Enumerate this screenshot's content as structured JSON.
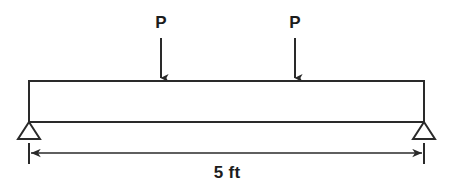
{
  "diagram": {
    "background_color": "#ffffff",
    "line_color": "#2a2a2a",
    "text_color": "#1c1c1c",
    "beam": {
      "left_x": 29,
      "right_x": 424,
      "top_y": 81,
      "bottom_y": 122,
      "stroke_width": 2
    },
    "loads": [
      {
        "label": "P",
        "x": 161,
        "label_y": 14,
        "shaft_top_y": 38,
        "tip_y": 81
      },
      {
        "label": "P",
        "x": 295,
        "label_y": 14,
        "shaft_top_y": 38,
        "tip_y": 81
      }
    ],
    "supports": [
      {
        "name": "left-pin-support",
        "apex_x": 29,
        "apex_y": 122,
        "half_width": 11,
        "height": 17
      },
      {
        "name": "right-pin-support",
        "apex_x": 424,
        "apex_y": 122,
        "half_width": 11,
        "height": 17
      }
    ],
    "dimension": {
      "label": "5 ft",
      "label_x": 227,
      "label_y": 164,
      "line_y": 153,
      "start_x": 29,
      "end_x": 424,
      "tick_top_y": 142,
      "tick_bottom_y": 164
    }
  }
}
